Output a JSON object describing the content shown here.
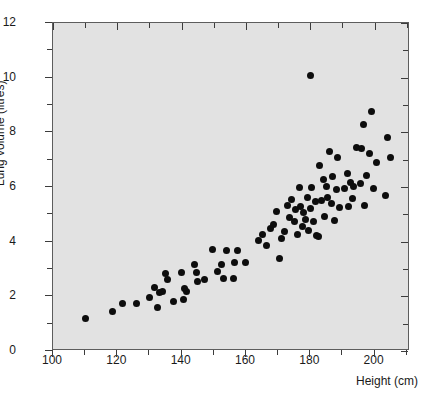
{
  "chart_data": {
    "type": "scatter",
    "title": "",
    "xlabel": "Height (cm)",
    "ylabel": "Lung volume (litres)",
    "xlim": [
      100,
      211
    ],
    "ylim": [
      0,
      12
    ],
    "xticks": [
      100,
      120,
      140,
      160,
      180,
      200
    ],
    "xticks_minor": [
      110,
      130,
      150,
      170,
      190,
      210
    ],
    "yticks": [
      0,
      2,
      4,
      6,
      8,
      10,
      12
    ],
    "yticks_minor": [
      1,
      3,
      5,
      7,
      9,
      11
    ],
    "xtick_labels": [
      "100",
      "120",
      "140",
      "160",
      "180",
      "200"
    ],
    "ytick_labels": [
      "0",
      "2",
      "4",
      "6",
      "8",
      "10",
      "12"
    ],
    "grid": false,
    "legend": null,
    "marker": "filled-circle",
    "marker_color": "#0d0d0d",
    "plot_background": "#e2e2e2",
    "n_points": 108,
    "points": [
      [
        110.0,
        1.18
      ],
      [
        118.5,
        1.45
      ],
      [
        121.5,
        1.73
      ],
      [
        126.0,
        1.72
      ],
      [
        130.0,
        1.97
      ],
      [
        131.5,
        2.33
      ],
      [
        132.5,
        1.6
      ],
      [
        133.0,
        2.13
      ],
      [
        134.0,
        2.18
      ],
      [
        135.0,
        2.82
      ],
      [
        135.5,
        2.62
      ],
      [
        137.5,
        1.82
      ],
      [
        140.0,
        2.87
      ],
      [
        140.5,
        1.88
      ],
      [
        141.0,
        2.28
      ],
      [
        141.5,
        2.18
      ],
      [
        144.0,
        3.18
      ],
      [
        144.5,
        2.87
      ],
      [
        145.0,
        2.55
      ],
      [
        147.0,
        2.62
      ],
      [
        149.5,
        3.7
      ],
      [
        151.0,
        2.92
      ],
      [
        152.5,
        3.18
      ],
      [
        153.0,
        2.65
      ],
      [
        154.0,
        3.67
      ],
      [
        156.0,
        2.65
      ],
      [
        156.5,
        3.23
      ],
      [
        157.5,
        3.67
      ],
      [
        160.0,
        3.22
      ],
      [
        164.0,
        4.05
      ],
      [
        165.0,
        4.28
      ],
      [
        166.5,
        3.86
      ],
      [
        167.5,
        4.48
      ],
      [
        168.5,
        4.63
      ],
      [
        169.5,
        5.1
      ],
      [
        170.5,
        3.4
      ],
      [
        171.0,
        4.12
      ],
      [
        172.0,
        4.37
      ],
      [
        173.0,
        5.32
      ],
      [
        173.5,
        4.9
      ],
      [
        174.0,
        5.53
      ],
      [
        175.0,
        4.72
      ],
      [
        175.5,
        5.18
      ],
      [
        176.0,
        4.28
      ],
      [
        176.5,
        5.98
      ],
      [
        177.0,
        5.3
      ],
      [
        177.5,
        4.55
      ],
      [
        178.0,
        5.05
      ],
      [
        178.5,
        4.8
      ],
      [
        179.0,
        5.62
      ],
      [
        179.5,
        4.42
      ],
      [
        180.0,
        10.08
      ],
      [
        180.0,
        5.22
      ],
      [
        180.5,
        6.0
      ],
      [
        181.0,
        4.72
      ],
      [
        181.5,
        5.48
      ],
      [
        182.0,
        4.22
      ],
      [
        182.5,
        4.18
      ],
      [
        183.0,
        6.8
      ],
      [
        183.5,
        5.52
      ],
      [
        184.0,
        6.28
      ],
      [
        184.5,
        4.92
      ],
      [
        185.0,
        6.02
      ],
      [
        185.5,
        5.62
      ],
      [
        186.0,
        7.3
      ],
      [
        186.5,
        5.4
      ],
      [
        187.0,
        6.38
      ],
      [
        187.5,
        4.78
      ],
      [
        188.0,
        5.92
      ],
      [
        188.5,
        7.08
      ],
      [
        189.0,
        5.25
      ],
      [
        190.5,
        5.95
      ],
      [
        191.5,
        6.48
      ],
      [
        192.0,
        5.3
      ],
      [
        192.5,
        6.18
      ],
      [
        193.0,
        5.58
      ],
      [
        193.5,
        6.02
      ],
      [
        194.5,
        7.45
      ],
      [
        195.5,
        6.12
      ],
      [
        196.0,
        7.4
      ],
      [
        196.5,
        8.3
      ],
      [
        197.0,
        5.33
      ],
      [
        197.5,
        6.42
      ],
      [
        198.5,
        7.22
      ],
      [
        199.0,
        8.75
      ],
      [
        199.5,
        5.95
      ],
      [
        200.5,
        6.88
      ],
      [
        203.5,
        5.7
      ],
      [
        204.0,
        7.8
      ],
      [
        205.0,
        7.08
      ]
    ]
  },
  "axis": {
    "y_title": "Lung volume (litres)",
    "x_title": "Height (cm)"
  },
  "caption": {
    "partial_text": ""
  }
}
